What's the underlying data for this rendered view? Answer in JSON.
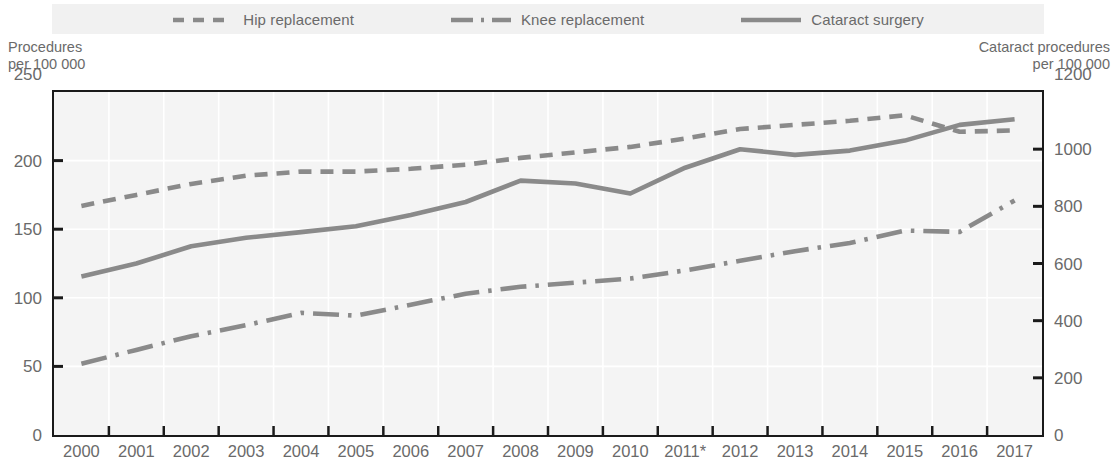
{
  "legend": {
    "items": [
      {
        "label": "Hip replacement",
        "style": "dashed",
        "icon": "dashed-line-icon",
        "color": "#8a8a8a"
      },
      {
        "label": "Knee replacement",
        "style": "dash-dot",
        "icon": "dash-dot-line-icon",
        "color": "#8a8a8a"
      },
      {
        "label": "Cataract surgery",
        "style": "solid",
        "icon": "solid-line-icon",
        "color": "#8a8a8a"
      }
    ]
  },
  "axes": {
    "left_title_line1": "Procedures",
    "left_title_line2": "per 100 000",
    "right_title_line1": "Cataract procedures",
    "right_title_line2": "per 100 000",
    "left_max_label": "250",
    "right_max_label": "1200",
    "left_ticks": [
      "250",
      "200",
      "150",
      "100",
      "50",
      "0"
    ],
    "right_ticks": [
      "1200",
      "1000",
      "800",
      "600",
      "400",
      "200",
      "0"
    ],
    "x_ticks": [
      "2000",
      "2001",
      "2002",
      "2003",
      "2004",
      "2005",
      "2006",
      "2007",
      "2008",
      "2009",
      "2010",
      "2011*",
      "2012",
      "2013",
      "2014",
      "2015",
      "2016",
      "2017"
    ]
  },
  "chart_data": {
    "type": "line",
    "title": "",
    "xlabel": "",
    "ylabel": "Procedures per 100 000",
    "y2label": "Cataract procedures per 100 000",
    "x": [
      "2000",
      "2001",
      "2002",
      "2003",
      "2004",
      "2005",
      "2006",
      "2007",
      "2008",
      "2009",
      "2010",
      "2011*",
      "2012",
      "2013",
      "2014",
      "2015",
      "2016",
      "2017"
    ],
    "ylim": [
      0,
      250
    ],
    "y2lim": [
      0,
      1200
    ],
    "grid": true,
    "legend_position": "top",
    "series": [
      {
        "name": "Hip replacement",
        "axis": "left",
        "style": "dashed",
        "color": "#8a8a8a",
        "values": [
          167,
          175,
          183,
          189,
          192,
          192,
          194,
          197,
          202,
          206,
          210,
          216,
          223,
          226,
          229,
          233,
          221,
          222
        ]
      },
      {
        "name": "Knee replacement",
        "axis": "left",
        "style": "dash-dot",
        "color": "#8a8a8a",
        "values": [
          52,
          62,
          72,
          80,
          89,
          87,
          95,
          103,
          108,
          111,
          114,
          120,
          127,
          134,
          140,
          149,
          148,
          171
        ]
      },
      {
        "name": "Cataract surgery",
        "axis": "right",
        "style": "solid",
        "color": "#8a8a8a",
        "values": [
          555,
          600,
          660,
          690,
          710,
          730,
          770,
          815,
          890,
          880,
          845,
          935,
          1000,
          980,
          995,
          1030,
          1085,
          1105
        ]
      }
    ]
  }
}
